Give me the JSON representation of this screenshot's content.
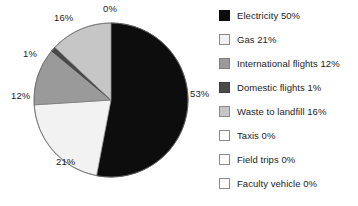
{
  "chart_data": {
    "type": "pie",
    "title": "",
    "labels": [
      "Electricity",
      "Gas",
      "International flights",
      "Domestic flights",
      "Waste to landfill",
      "Taxis",
      "Field trips",
      "Faculty vehicle"
    ],
    "values": [
      50,
      21,
      12,
      1,
      16,
      0,
      0,
      0
    ],
    "slice_colors": [
      "#0d0d0d",
      "#f2f2f2",
      "#9a9a9a",
      "#4a4a4a",
      "#c6c6c6",
      "#ffffff",
      "#ffffff",
      "#ffffff"
    ],
    "slice_label_texts": [
      "0%",
      "53%",
      "21%",
      "12%",
      "1%",
      "16%"
    ],
    "start_angle_deg": 0,
    "direction": "clockwise",
    "legend_position": "right",
    "grid": false
  },
  "pie": {
    "geometry": {
      "center_x": 111,
      "center_y": 100,
      "radius": 77
    },
    "slices": [
      {
        "name": "electricity",
        "value": 50,
        "start_deg": 0,
        "sweep_deg": 190.8,
        "color": "#0d0d0d",
        "edge": "#111111"
      },
      {
        "name": "gas",
        "value": 21,
        "start_deg": 190.8,
        "sweep_deg": 75.6,
        "color": "#f2f2f2",
        "edge": "#8c8c8c"
      },
      {
        "name": "international-flights",
        "value": 12,
        "start_deg": 266.4,
        "sweep_deg": 43.2,
        "color": "#9a9a9a",
        "edge": "#7a7a7a"
      },
      {
        "name": "domestic-flights",
        "value": 1,
        "start_deg": 309.6,
        "sweep_deg": 3.6,
        "color": "#4a4a4a",
        "edge": "#3d3d3d"
      },
      {
        "name": "waste-to-landfill",
        "value": 16,
        "start_deg": 313.2,
        "sweep_deg": 46.8,
        "color": "#c6c6c6",
        "edge": "#8f8f8f"
      }
    ],
    "callouts": [
      {
        "key": "zero-top",
        "text": "0%",
        "x": 103,
        "y": 3
      },
      {
        "key": "electricity-right",
        "text": "53%",
        "x": 190,
        "y": 88
      },
      {
        "key": "gas",
        "text": "21%",
        "x": 56,
        "y": 156
      },
      {
        "key": "international-flights",
        "text": "12%",
        "x": 11,
        "y": 90
      },
      {
        "key": "domestic-flights",
        "text": "1%",
        "x": 23,
        "y": 48
      },
      {
        "key": "waste-to-landfill",
        "text": "16%",
        "x": 54,
        "y": 12
      }
    ]
  },
  "legend": {
    "items": [
      {
        "label": "Electricity 50%",
        "color": "#0d0d0d",
        "border": "#0d0d0d"
      },
      {
        "label": "Gas 21%",
        "color": "#f2f2f2",
        "border": "#8a8a8a"
      },
      {
        "label": "International flights 12%",
        "color": "#9a9a9a",
        "border": "#7f7f7f"
      },
      {
        "label": "Domestic flights 1%",
        "color": "#4a4a4a",
        "border": "#3f3f3f"
      },
      {
        "label": "Waste to landfill 16%",
        "color": "#c6c6c6",
        "border": "#8a8a8a"
      },
      {
        "label": "Taxis 0%",
        "color": "#ffffff",
        "border": "#8a8a8a"
      },
      {
        "label": "Field trips 0%",
        "color": "#ffffff",
        "border": "#8a8a8a"
      },
      {
        "label": "Faculty vehicle 0%",
        "color": "#ffffff",
        "border": "#8a8a8a"
      }
    ]
  }
}
